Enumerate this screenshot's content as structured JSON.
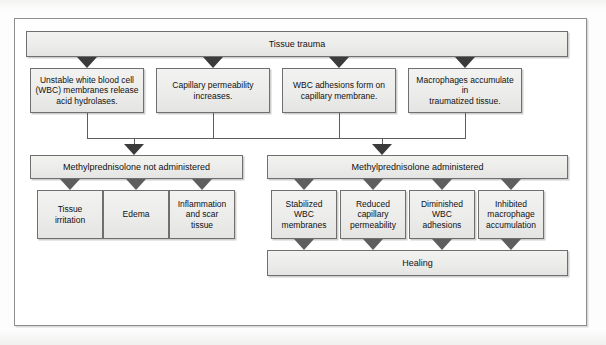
{
  "diagram": {
    "type": "flowchart",
    "root": {
      "label": "Tissue trauma"
    },
    "mechanisms": [
      {
        "label": "Unstable white blood cell\n(WBC) membranes release\nacid hydrolases."
      },
      {
        "label": "Capillary permeability\nincreases."
      },
      {
        "label": "WBC adhesions form on\ncapillary membrane."
      },
      {
        "label": "Macrophages accumulate in\ntraumatized tissue."
      }
    ],
    "branches": [
      {
        "label": "Methylprednisolone not administered",
        "outcomes": [
          {
            "label": "Tissue\nirritation"
          },
          {
            "label": "Edema"
          },
          {
            "label": "Inflammation\nand scar\ntissue"
          }
        ]
      },
      {
        "label": "Methylprednisolone administered",
        "outcomes": [
          {
            "label": "Stabilized\nWBC\nmembranes"
          },
          {
            "label": "Reduced\ncapillary\npermeability"
          },
          {
            "label": "Diminished\nWBC\nadhesions"
          },
          {
            "label": "Inhibited\nmacrophage\naccumulation"
          }
        ],
        "result": {
          "label": "Healing"
        }
      }
    ],
    "colors": {
      "box_fill": "#ececeb",
      "box_border": "#6f6f6f",
      "arrow": "#3b3b3b",
      "frame_border": "#8d8d8d",
      "page_background": "#fbfbfa"
    }
  }
}
